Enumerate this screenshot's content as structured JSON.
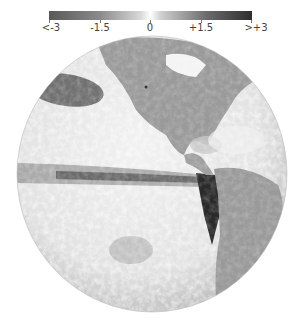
{
  "colorbar": {
    "labels": [
      "<-3",
      "-1.5",
      "0",
      "+1.5",
      ">+3"
    ],
    "min_label": "<-3",
    "max_label": ">+3",
    "colors": {
      "low": "#595959",
      "mid": "#ffffff",
      "high": "#2e2e2e"
    }
  },
  "map": {
    "projection": "orthographic globe",
    "regions": [
      "North America",
      "South America",
      "Pacific Ocean"
    ],
    "colors": {
      "land": "#9a9a9a",
      "ocean_light": "#ececec",
      "ocean_mid": "#c4c4c4",
      "anomaly_dark": "#3a3a3a"
    }
  }
}
